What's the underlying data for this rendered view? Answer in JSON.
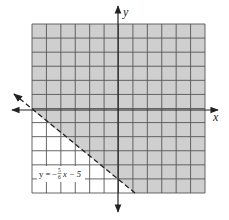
{
  "chart_data": {
    "type": "line",
    "title": "",
    "xlabel": "x",
    "ylabel": "y",
    "xlim": [
      -6,
      6
    ],
    "ylim": [
      -6,
      6
    ],
    "grid": true,
    "grid_step": 1,
    "series": [
      {
        "name": "y = -5/6 x - 5",
        "style": "dashed",
        "slope": -0.8333,
        "intercept": -5,
        "x": [
          -7,
          1.2
        ],
        "y": [
          0.8333,
          -6
        ]
      }
    ],
    "shaded_region": {
      "inequality": "y > -5/6 x - 5",
      "side": "above",
      "color": "#c8c8c8"
    },
    "annotations": [
      {
        "text": "y = −(5/6)x − 5",
        "x": -5.5,
        "y": -4.5
      }
    ]
  },
  "labels": {
    "x_axis": "x",
    "y_axis": "y",
    "equation_prefix": "y = −",
    "frac_num": "5",
    "frac_den": "6",
    "equation_suffix": "x − 5"
  },
  "colors": {
    "shade": "#cfcfcf",
    "grid": "#555555",
    "axis": "#222222"
  }
}
